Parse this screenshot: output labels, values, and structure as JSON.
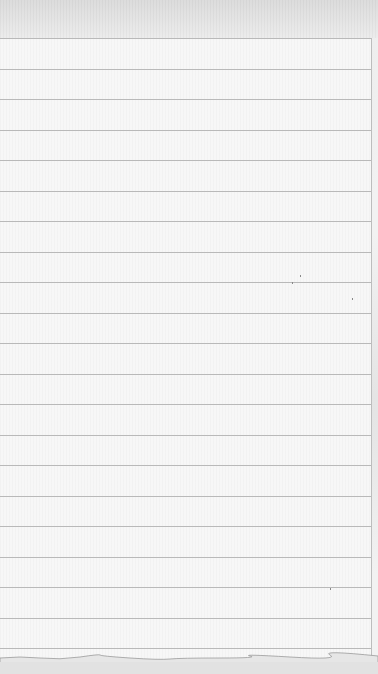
{
  "page": {
    "type": "blank-lined-notepad",
    "text_content": [],
    "colors": {
      "paper": "#f7f7f7",
      "rule_line": "#b9b9b9",
      "edge": "#bdbdbd",
      "top_strip": "#dcdcdc"
    },
    "rule_lines": {
      "count": 21,
      "first_y": 38,
      "spacing": 30.5
    }
  }
}
